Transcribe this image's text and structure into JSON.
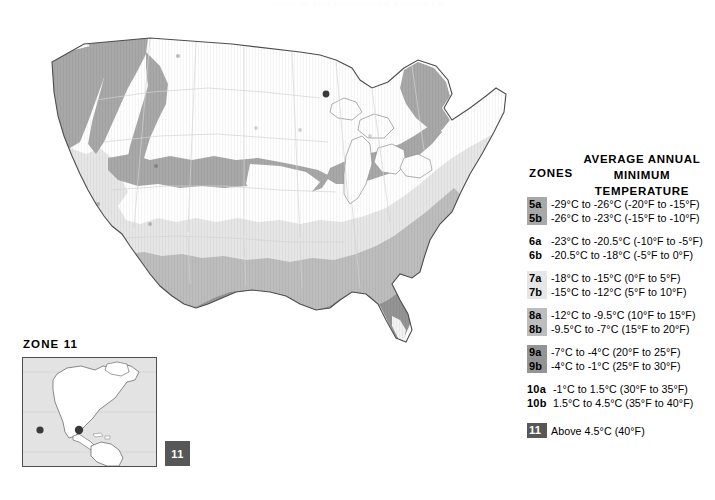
{
  "page": {
    "title_cropped": "USDA PLANT HARDINESS ZONE MAP"
  },
  "legend": {
    "zones_heading": "ZONES",
    "temp_heading_line1": "AVERAGE ANNUAL",
    "temp_heading_line2": "MINIMUM TEMPERATURE",
    "groups": [
      {
        "swatch_color": "#a8a8a8",
        "rows": [
          {
            "zone": "5a",
            "text": "-29°C to -26°C (-20°F to -15°F)"
          },
          {
            "zone": "5b",
            "text": "-26°C to -23°C (-15°F to -10°F)"
          }
        ]
      },
      {
        "swatch_color": "#ffffff",
        "rows": [
          {
            "zone": "6a",
            "text": "-23°C to -20.5°C (-10°F to -5°F)"
          },
          {
            "zone": "6b",
            "text": "-20.5°C to -18°C (-5°F to 0°F)"
          }
        ]
      },
      {
        "swatch_color": "#e6e6e6",
        "rows": [
          {
            "zone": "7a",
            "text": "-18°C to -15°C (0°F to 5°F)"
          },
          {
            "zone": "7b",
            "text": "-15°C to -12°C (5°F to 10°F)"
          }
        ]
      },
      {
        "swatch_color": "#bdbdbd",
        "rows": [
          {
            "zone": "8a",
            "text": "-12°C to -9.5°C (10°F to 15°F)"
          },
          {
            "zone": "8b",
            "text": "-9.5°C to -7°C (15°F to 20°F)"
          }
        ]
      },
      {
        "swatch_color": "#949494",
        "rows": [
          {
            "zone": "9a",
            "text": "-7°C to -4°C (20°F to 25°F)"
          },
          {
            "zone": "9b",
            "text": "-4°C to -1°C (25°F to 30°F)"
          }
        ]
      },
      {
        "swatch_color": "#ffffff",
        "wide": true,
        "rows": [
          {
            "zone": "10a",
            "text": "-1°C to 1.5°C (30°F to 35°F)"
          },
          {
            "zone": "10b",
            "text": "1.5°C to 4.5°C (35°F to 40°F)"
          }
        ]
      },
      {
        "swatch_color": "#575757",
        "single": true,
        "rows": [
          {
            "zone": "11",
            "text": "Above 4.5°C (40°F)"
          }
        ]
      }
    ]
  },
  "inset": {
    "title": "ZONE 11",
    "chip_label": "11"
  },
  "colors": {
    "zone5": "#a8a8a8",
    "zone6": "#ffffff",
    "zone7": "#e6e6e6",
    "zone8": "#bdbdbd",
    "zone9": "#949494",
    "zone10": "#f2f2f2",
    "zone11": "#575757",
    "outline": "#4d4d4d",
    "state_line": "#d4d4d4",
    "ocean": "#ffffff",
    "inset_sea": "#e3e3e3",
    "inset_land": "#ffffff",
    "city_dot": "#3a3a3a"
  }
}
